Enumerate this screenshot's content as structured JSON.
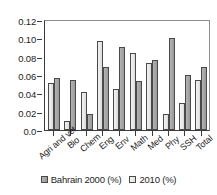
{
  "chart_data": {
    "type": "bar",
    "title": "",
    "xlabel": "",
    "ylabel": "",
    "ylim": [
      0.0,
      0.12
    ],
    "grid": false,
    "legend_position": "bottom",
    "categories": [
      "Agri and vet",
      "Bio",
      "Chem",
      "Eng",
      "Env",
      "Math",
      "Med",
      "Phy",
      "SSH",
      "Total"
    ],
    "ytick_labels": [
      "0.12",
      "0.10",
      "0.08",
      "0.06",
      "0.04",
      "0.02",
      "0.0"
    ],
    "ytick_values": [
      0.12,
      0.1,
      0.08,
      0.06,
      0.04,
      0.02,
      0.0
    ],
    "series": [
      {
        "name": "2010 (%)",
        "color": "#e8e8e8",
        "values": [
          0.051,
          0.01,
          0.042,
          0.097,
          0.045,
          0.084,
          0.073,
          0.017,
          0.03,
          0.055
        ]
      },
      {
        "name": "Bahrain 2000 (%)",
        "color": "#a6a6a6",
        "values": [
          0.057,
          0.055,
          0.017,
          0.069,
          0.091,
          0.053,
          0.076,
          0.1,
          0.06,
          0.069
        ]
      }
    ]
  },
  "legend": {
    "items": [
      {
        "label": "Bahrain 2000 (%)",
        "swatch": "dark-gray-swatch-icon"
      },
      {
        "label": "2010 (%)",
        "swatch": "light-gray-swatch-icon"
      }
    ]
  }
}
